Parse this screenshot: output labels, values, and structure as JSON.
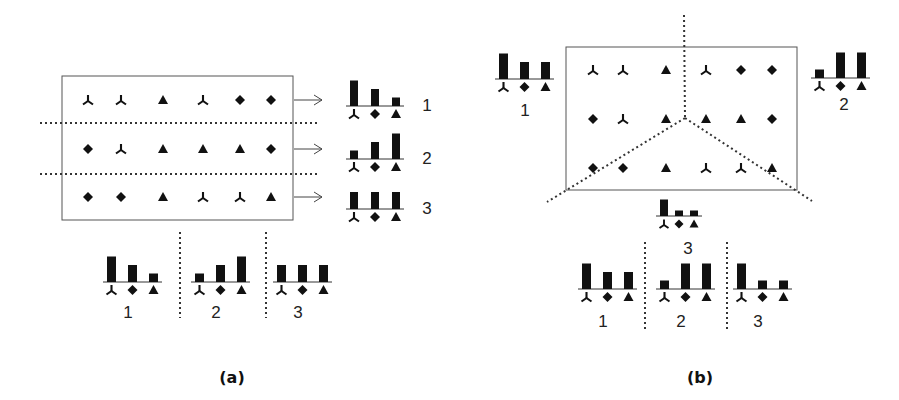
{
  "colors": {
    "ink": "#111111",
    "frame": "#555555",
    "dots": "#333333"
  },
  "panel_a": {
    "caption": "(a)",
    "grid": [
      [
        "tri-y",
        "tri-y",
        "triangle",
        "tri-y",
        "diamond",
        "diamond"
      ],
      [
        "diamond",
        "tri-y",
        "triangle",
        "triangle",
        "triangle",
        "diamond"
      ],
      [
        "diamond",
        "diamond",
        "triangle",
        "tri-y",
        "tri-y",
        "triangle"
      ]
    ],
    "row_histograms": [
      {
        "label": "1",
        "values": [
          3,
          2,
          1
        ]
      },
      {
        "label": "2",
        "values": [
          1,
          2,
          3
        ]
      },
      {
        "label": "3",
        "values": [
          2,
          2,
          2
        ]
      }
    ],
    "concat_histogram": {
      "groups": [
        {
          "label": "1",
          "values": [
            3,
            2,
            1
          ]
        },
        {
          "label": "2",
          "values": [
            1,
            2,
            3
          ]
        },
        {
          "label": "3",
          "values": [
            2,
            2,
            2
          ]
        }
      ]
    }
  },
  "panel_b": {
    "caption": "(b)",
    "grid": [
      [
        "tri-y",
        "tri-y",
        "triangle",
        "tri-y",
        "diamond",
        "diamond"
      ],
      [
        "diamond",
        "tri-y",
        "triangle",
        "triangle",
        "triangle",
        "diamond"
      ],
      [
        "diamond",
        "diamond",
        "triangle",
        "tri-y",
        "tri-y",
        "triangle"
      ]
    ],
    "region_histograms": [
      {
        "label": "1",
        "values": [
          3,
          2,
          2
        ]
      },
      {
        "label": "2",
        "values": [
          1,
          3,
          3
        ]
      },
      {
        "label": "3",
        "values": [
          3,
          1,
          1
        ]
      }
    ],
    "concat_histogram": {
      "groups": [
        {
          "label": "1",
          "values": [
            3,
            2,
            2
          ]
        },
        {
          "label": "2",
          "values": [
            1,
            3,
            3
          ]
        },
        {
          "label": "3",
          "values": [
            3,
            1,
            1
          ]
        }
      ]
    }
  },
  "legend_order": [
    "tri-y",
    "diamond",
    "triangle"
  ]
}
